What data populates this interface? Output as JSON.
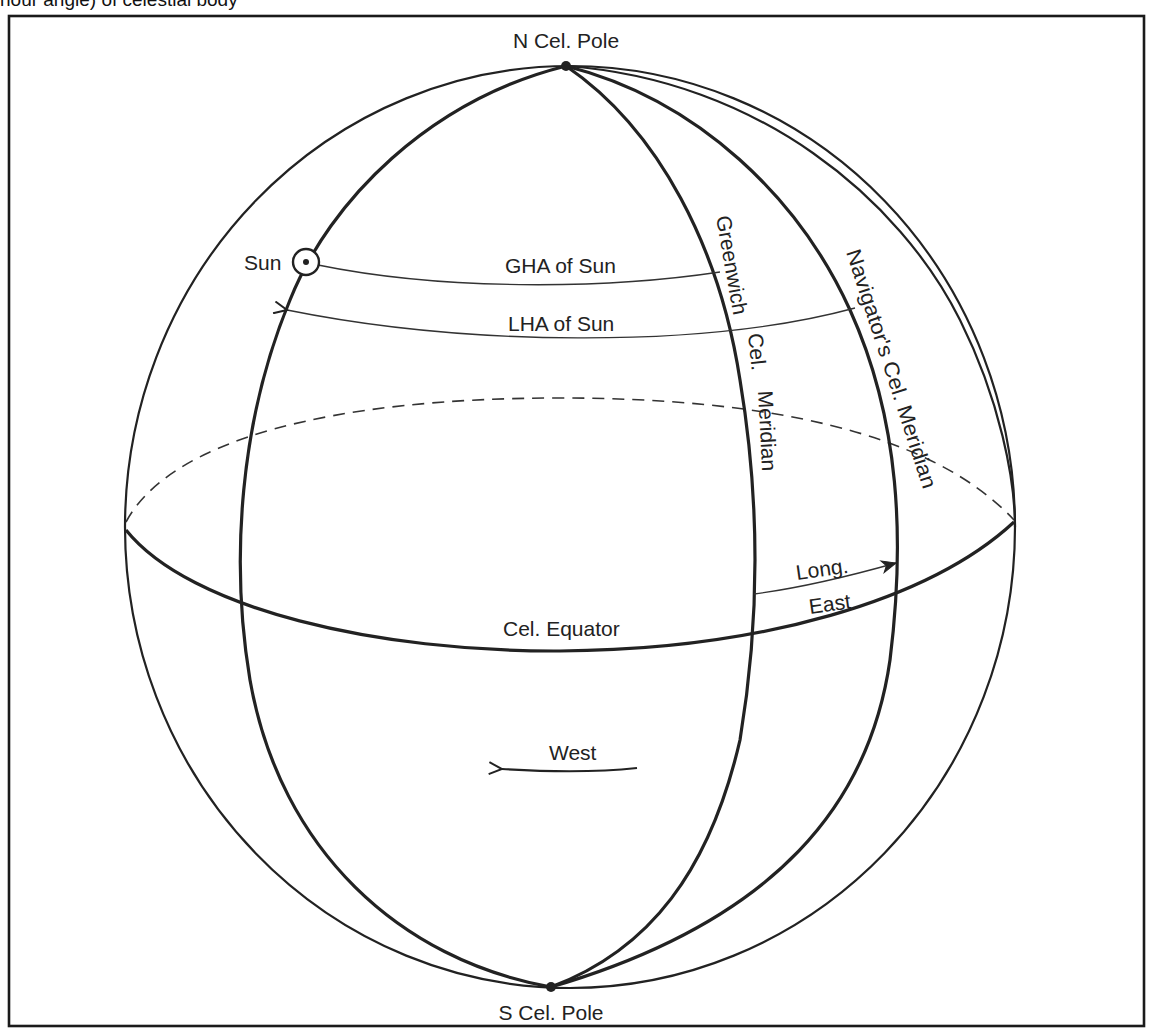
{
  "caption_fragment": "hour angle) of celestial body",
  "diagram": {
    "labels": {
      "north_pole": "N Cel. Pole",
      "south_pole": "S Cel. Pole",
      "sun": "Sun",
      "gha": "GHA of Sun",
      "lha": "LHA of Sun",
      "greenwich_line1": "Greenwich",
      "greenwich_line2": "Cel.",
      "greenwich_line3": "Meridian",
      "navigator": "Navigator's Cel. Meridian",
      "longitude_top": "Long.",
      "longitude_bottom": "East",
      "equator": "Cel. Equator",
      "west": "West"
    },
    "elements": [
      "sphere-outline",
      "celestial-equator",
      "sun-hour-circle",
      "greenwich-celestial-meridian",
      "navigators-celestial-meridian",
      "outer-meridian",
      "gha-arrow",
      "lha-arrow",
      "longitude-east-arrow",
      "west-direction-arrow",
      "north-pole-point",
      "south-pole-point",
      "sun-symbol"
    ],
    "colors": {
      "line": "#222222",
      "background": "#ffffff",
      "frame": "#1a1a1a"
    }
  }
}
